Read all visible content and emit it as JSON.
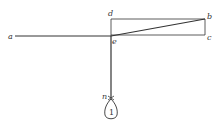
{
  "diagram": {
    "labels": {
      "a": "a",
      "b": "b",
      "c": "c",
      "d": "d",
      "e": "e",
      "n": "n"
    },
    "weight_label": "1",
    "colors": {
      "line": "#333333",
      "background": "#ffffff"
    }
  }
}
